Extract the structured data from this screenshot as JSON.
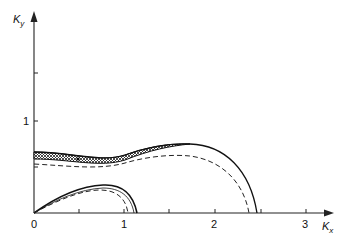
{
  "diagram": {
    "axes": {
      "x_label": "K",
      "x_label_sub": "x",
      "y_label": "K",
      "y_label_sub": "y",
      "x_ticks": [
        {
          "value": 0,
          "label": "0"
        },
        {
          "value": 0.5,
          "label": ""
        },
        {
          "value": 1,
          "label": "1"
        },
        {
          "value": 1.5,
          "label": ""
        },
        {
          "value": 2,
          "label": "2"
        },
        {
          "value": 2.5,
          "label": ""
        },
        {
          "value": 3,
          "label": "3"
        }
      ],
      "y_ticks": [
        {
          "value": 0.5,
          "label": ""
        },
        {
          "value": 1,
          "label": "1"
        },
        {
          "value": 1.5,
          "label": ""
        }
      ]
    },
    "curves": [
      {
        "name": "outer-solid",
        "style": "solid",
        "description": "Outer lobe boundary; starts at Ky≈0.66, peaks ≈0.76 near Kx≈1.6, meets Kx axis at ≈2.45"
      },
      {
        "name": "outer-dashed",
        "style": "dashed",
        "description": "Outer lobe inner approximation; starts at Ky≈0.55, meets Kx axis at ≈2.37"
      },
      {
        "name": "outer-band",
        "style": "hatched",
        "description": "Cross-hatched band between Ky≈0.58–0.66 at Kx=0 narrowing toward Kx≈1.7"
      },
      {
        "name": "inner-solid",
        "style": "solid",
        "description": "Small lobe from origin, peaks Ky≈0.31 near Kx≈0.75, meets Kx axis at ≈1.14"
      },
      {
        "name": "inner-dashed",
        "style": "dashed",
        "description": "Small lobe approximation, peaks Ky≈0.27, meets Kx axis at ≈1.04"
      }
    ]
  }
}
